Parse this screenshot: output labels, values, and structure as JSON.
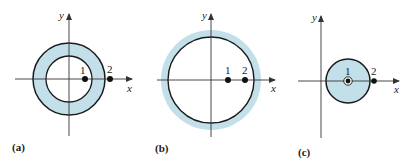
{
  "colors": {
    "fill": "#c3e0ea",
    "stroke": "#1a1a1a",
    "axis": "#333333"
  },
  "panels": [
    {
      "label": "(a)",
      "description": "Annulus (shaded ring) with point 1 inside the inner hole and point 2 outside",
      "axes": {
        "x": "x",
        "y": "y"
      },
      "points": [
        {
          "label": "1"
        },
        {
          "label": "2"
        }
      ]
    },
    {
      "label": "(b)",
      "description": "Large circle with shaded band outside it; points 1 and 2 both inside",
      "axes": {
        "x": "x",
        "y": "y"
      },
      "points": [
        {
          "label": "1"
        },
        {
          "label": "2"
        }
      ]
    },
    {
      "label": "(c)",
      "description": "Shaded disk with point 1 at center (circled) and point 2 outside",
      "axes": {
        "x": "x",
        "y": "y"
      },
      "points": [
        {
          "label": "1"
        },
        {
          "label": "2"
        }
      ]
    }
  ]
}
